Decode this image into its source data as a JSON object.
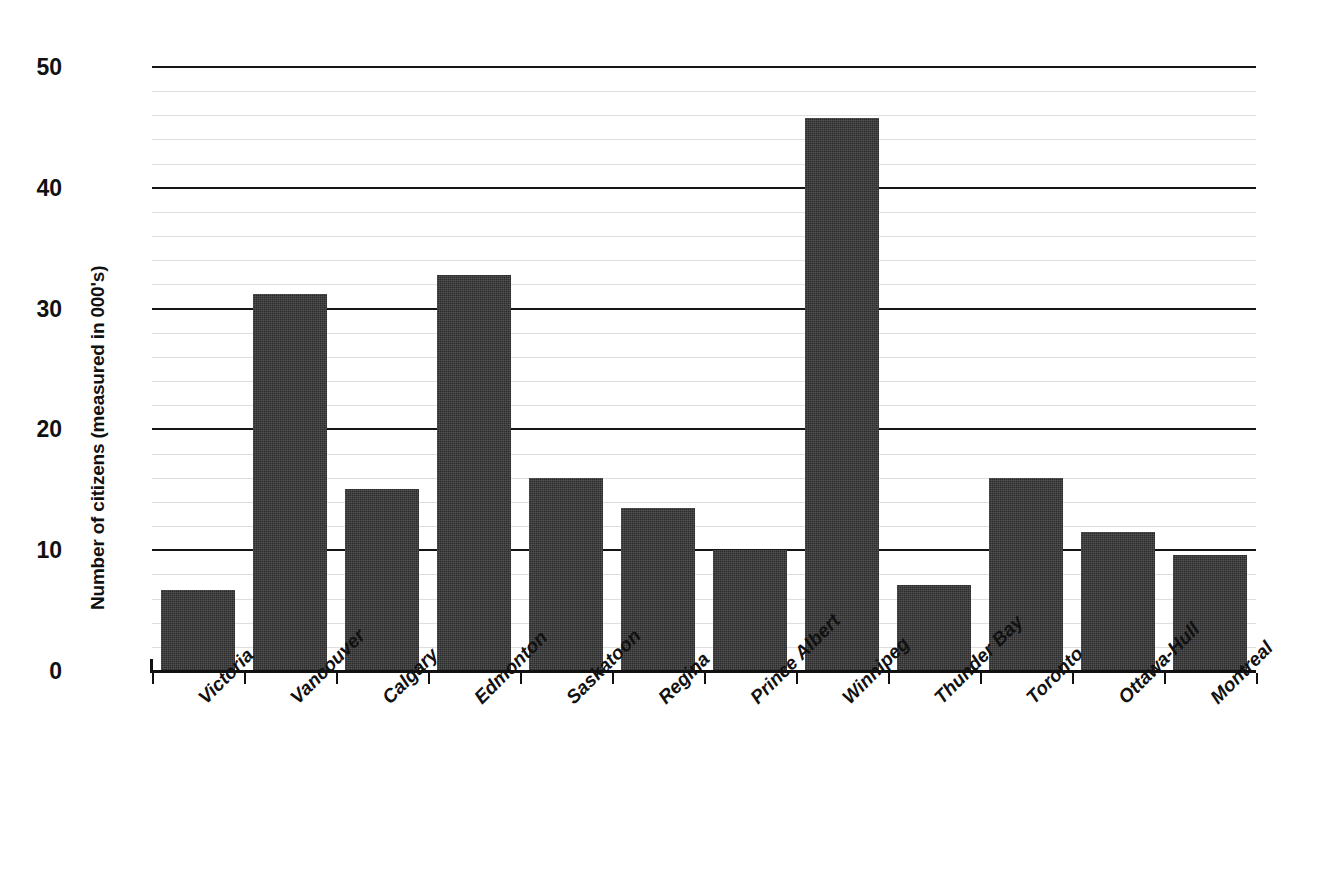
{
  "chart_data": {
    "type": "bar",
    "title": "",
    "xlabel": "",
    "ylabel": "Number of citizens (measured in 000's)",
    "ylim": [
      0,
      50
    ],
    "ytick_labels": [
      "0",
      "10",
      "20",
      "30",
      "40",
      "50"
    ],
    "ytick_values": [
      0,
      10,
      20,
      30,
      40,
      50
    ],
    "minor_tick_step": 2,
    "grid": true,
    "legend": false,
    "bar_color": "#2b2b2b",
    "categories": [
      "Victoria",
      "Vancouver",
      "Calgary",
      "Edmonton",
      "Saskatoon",
      "Regina",
      "Prince Albert",
      "Winnipeg",
      "Thunder Bay",
      "Toronto",
      "Ottawa-Hull",
      "Montreal"
    ],
    "values": [
      6.7,
      31.2,
      15.1,
      32.8,
      16.0,
      13.5,
      10.0,
      45.8,
      7.1,
      16.0,
      11.5,
      9.6
    ]
  },
  "axis": {
    "y_title": "Number of citizens (measured in 000's)"
  }
}
